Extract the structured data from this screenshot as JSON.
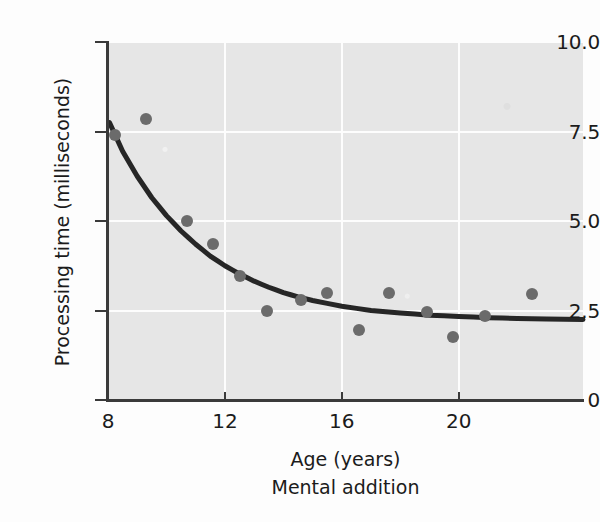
{
  "figure": {
    "background_color": "#fdfdfd",
    "panel_color": "#e6e6e6",
    "gridline_color": "#ffffff",
    "axis_color": "#3a3a3a",
    "caption": "Mental addition"
  },
  "chart_data": {
    "type": "scatter",
    "title": "",
    "subtitle": "",
    "caption": "Mental addition",
    "xlabel": "Age (years)",
    "ylabel": "Processing time (milliseconds)",
    "xlim": [
      8,
      24.25
    ],
    "ylim": [
      0,
      10.0
    ],
    "xticks": [
      8,
      12,
      16,
      20
    ],
    "xticklabels": [
      "8",
      "12",
      "16",
      "20"
    ],
    "yticks": [
      0,
      2.5,
      5.0,
      7.5,
      10.0
    ],
    "yticklabels": [
      "0",
      "2.5",
      "5.0",
      "7.5",
      "10.0"
    ],
    "grid": true,
    "grid_axes": "both",
    "legend": "none",
    "marker_color": "#6b6b6b",
    "marker_size": 12,
    "points": [
      {
        "x": 8.25,
        "y": 7.4
      },
      {
        "x": 9.3,
        "y": 7.85
      },
      {
        "x": 10.7,
        "y": 5.0
      },
      {
        "x": 11.6,
        "y": 4.35
      },
      {
        "x": 12.5,
        "y": 3.45
      },
      {
        "x": 13.45,
        "y": 2.5
      },
      {
        "x": 14.6,
        "y": 2.8
      },
      {
        "x": 15.5,
        "y": 3.0
      },
      {
        "x": 16.6,
        "y": 1.95
      },
      {
        "x": 17.6,
        "y": 3.0
      },
      {
        "x": 18.9,
        "y": 2.45
      },
      {
        "x": 19.8,
        "y": 1.75
      },
      {
        "x": 20.9,
        "y": 2.35
      },
      {
        "x": 22.5,
        "y": 2.95
      }
    ],
    "fit_curve": {
      "style": "exponential-decay",
      "color": "#262626",
      "line_width": 5,
      "description": "Processing time declines steeply from about 7.7 ms at age 8 and levels off near 2.3 ms by the early twenties.",
      "points": [
        {
          "x": 8.05,
          "y": 7.75
        },
        {
          "x": 8.5,
          "y": 6.95
        },
        {
          "x": 9.0,
          "y": 6.25
        },
        {
          "x": 9.5,
          "y": 5.65
        },
        {
          "x": 10.0,
          "y": 5.15
        },
        {
          "x": 10.5,
          "y": 4.72
        },
        {
          "x": 11.0,
          "y": 4.35
        },
        {
          "x": 11.5,
          "y": 4.02
        },
        {
          "x": 12.0,
          "y": 3.75
        },
        {
          "x": 12.5,
          "y": 3.52
        },
        {
          "x": 13.0,
          "y": 3.32
        },
        {
          "x": 13.5,
          "y": 3.15
        },
        {
          "x": 14.0,
          "y": 3.0
        },
        {
          "x": 14.5,
          "y": 2.88
        },
        {
          "x": 15.0,
          "y": 2.78
        },
        {
          "x": 16.0,
          "y": 2.62
        },
        {
          "x": 17.0,
          "y": 2.5
        },
        {
          "x": 18.0,
          "y": 2.43
        },
        {
          "x": 19.0,
          "y": 2.37
        },
        {
          "x": 20.0,
          "y": 2.33
        },
        {
          "x": 21.0,
          "y": 2.3
        },
        {
          "x": 22.0,
          "y": 2.28
        },
        {
          "x": 23.0,
          "y": 2.26
        },
        {
          "x": 24.25,
          "y": 2.25
        }
      ]
    }
  }
}
